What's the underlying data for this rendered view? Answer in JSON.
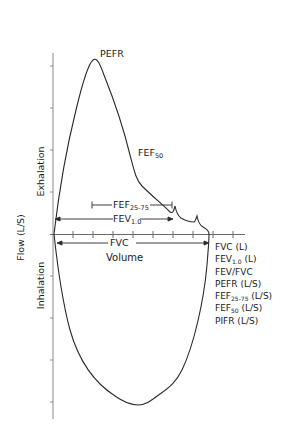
{
  "diagram": {
    "type": "flow-volume loop",
    "axes": {
      "y_label": "Flow (L/S)",
      "x_label": "Volume",
      "upper_region_label": "Exhalation",
      "lower_region_label": "Inhalation"
    },
    "annotations": {
      "pefr": "PEFR",
      "fef50": {
        "base": "FEF",
        "sub": "50"
      },
      "fef2575": {
        "base": "FEF",
        "sub": "25-75"
      },
      "fev1": {
        "base": "FEV",
        "sub": "1.0"
      },
      "fvc": "FVC"
    },
    "legend": [
      {
        "base": "FVC (L)",
        "sub": "",
        "suffix": ""
      },
      {
        "base": "FEV",
        "sub": "1.0",
        "suffix": " (L)"
      },
      {
        "base": "FEV/FVC",
        "sub": "",
        "suffix": ""
      },
      {
        "base": "PEFR (L/S)",
        "sub": "",
        "suffix": ""
      },
      {
        "base": "FEF",
        "sub": "25-75",
        "suffix": " (L/S)"
      },
      {
        "base": "FEF",
        "sub": "50",
        "suffix": " (L/S)"
      },
      {
        "base": "PIFR (L/S)",
        "sub": "",
        "suffix": ""
      }
    ],
    "colors": {
      "curve": "#2a2a2a",
      "axis": "#8a8a8a",
      "arrow": "#2a2a2a",
      "text": "#1a1a1a",
      "background": "#ffffff"
    }
  }
}
